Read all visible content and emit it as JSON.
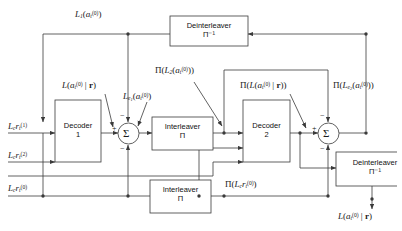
{
  "diagram": {
    "type": "block-diagram",
    "background": "#ffffff",
    "line_color": "#3a3a3a",
    "text_color": "#1a1a1a"
  },
  "blocks": {
    "decoder1": {
      "line1": "Decoder",
      "line2": "1"
    },
    "decoder2": {
      "line1": "Decoder",
      "line2": "2"
    },
    "interleaver_mid": {
      "line1": "Interleaver",
      "line2": "Π"
    },
    "interleaver_bottom": {
      "line1": "Interleaver",
      "line2": "Π"
    },
    "deinterleaver_top": {
      "line1": "Deinterleaver",
      "line2": "Π⁻¹"
    },
    "deinterleaver_right": {
      "line1": "Deinterleaver",
      "line2": "Π⁻¹"
    }
  },
  "adders": {
    "sum_left": {
      "symbol": "Σ",
      "signs": [
        "−",
        "+",
        "−"
      ]
    },
    "sum_right": {
      "symbol": "Σ",
      "signs": [
        "−",
        "+",
        "−"
      ]
    }
  },
  "signals": {
    "feedback_top": "L₁(a_t^(0))",
    "llr_decoder1": "L(a_t^(0) | r)",
    "extrinsic1": "L_e1(a_t^(0))",
    "interleaved_L2": "Π(L₂(a_t^(0)))",
    "interleaved_llr": "Π(L(a_t^(0) | r))",
    "interleaved_ext2": "Π(L_e2(a_t^(0)))",
    "input_systematic": "L_c r_t^(1)",
    "input_parity2": "L_c r_t^(2)",
    "input_parity0": "L_c r_t^(0)",
    "interleaved_input": "Π(L_c r_t^(0))",
    "output_llr": "L(a_t^(0) | r)"
  },
  "notation": {
    "L": "L",
    "Lc": "L_c",
    "a": "a",
    "r_vec": "r",
    "t": "t",
    "sup0": "(0)",
    "sup1": "(1)",
    "sup2": "(2)",
    "Pi": "Π",
    "Pi_inv": "Π⁻¹",
    "Sigma": "Σ",
    "plus": "+",
    "minus": "−"
  }
}
